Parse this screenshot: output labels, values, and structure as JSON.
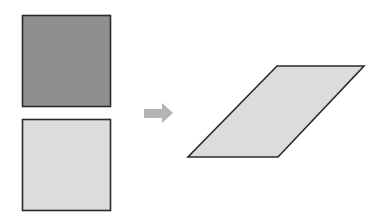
{
  "diagram": {
    "shapes": {
      "top_square": {
        "fill": "#8f8f8f",
        "stroke": "#2a2a2a"
      },
      "bottom_square": {
        "fill": "#dcdcdc",
        "stroke": "#2a2a2a"
      },
      "arrow": {
        "fill": "#b4b4b4",
        "direction": "right"
      },
      "parallelogram": {
        "fill": "#dcdcdc",
        "stroke": "#2a2a2a"
      }
    }
  }
}
